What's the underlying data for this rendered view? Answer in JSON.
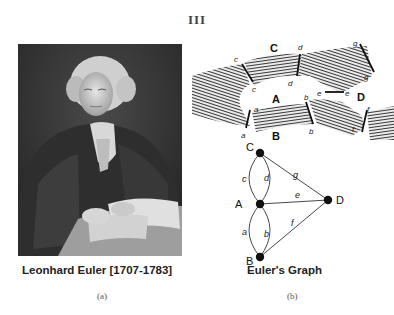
{
  "figure": {
    "number_label": "III"
  },
  "panel_a": {
    "caption": "Leonhard Euler [1707-1783]",
    "sub_label": "(a)",
    "image_description": "Engraved portrait of Leonhard Euler seated at a desk with papers"
  },
  "panel_b": {
    "caption": "Euler's Graph",
    "sub_label": "(b)",
    "map": {
      "land_labels": [
        "A",
        "B",
        "C",
        "D"
      ],
      "bridge_labels": [
        "a",
        "b",
        "c",
        "d",
        "e",
        "f",
        "g"
      ]
    },
    "graph": {
      "nodes": [
        {
          "id": "C",
          "label": "C"
        },
        {
          "id": "A",
          "label": "A"
        },
        {
          "id": "B",
          "label": "B"
        },
        {
          "id": "D",
          "label": "D"
        }
      ],
      "edges": [
        {
          "label": "c",
          "from": "A",
          "to": "C"
        },
        {
          "label": "d",
          "from": "A",
          "to": "C"
        },
        {
          "label": "a",
          "from": "A",
          "to": "B"
        },
        {
          "label": "b",
          "from": "A",
          "to": "B"
        },
        {
          "label": "e",
          "from": "A",
          "to": "D"
        },
        {
          "label": "f",
          "from": "B",
          "to": "D"
        },
        {
          "label": "g",
          "from": "C",
          "to": "D"
        }
      ]
    }
  },
  "colors": {
    "ink": "#222222",
    "portrait_bg": "#3a3a3a",
    "paper": "#ffffff"
  }
}
